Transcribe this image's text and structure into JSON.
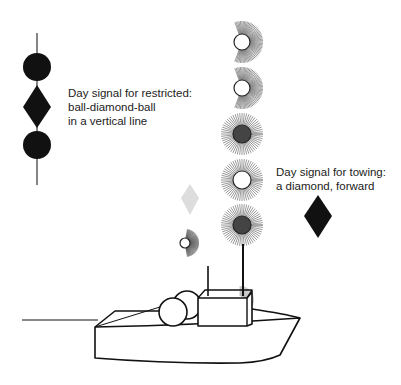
{
  "labels": {
    "restricted": {
      "line1": "Day signal for restricted:",
      "line2": "ball-diamond-ball",
      "line3": "in a vertical line"
    },
    "towing": {
      "line1": "Day signal for towing:",
      "line2": "a diamond, forward"
    }
  },
  "colors": {
    "shape": "#111111",
    "line": "#222222",
    "rays": "#666666",
    "background": "#ffffff"
  }
}
